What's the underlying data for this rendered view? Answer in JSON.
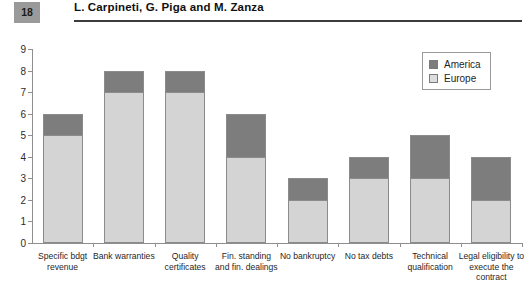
{
  "header": {
    "folio": "18",
    "authors": "L. Carpineti, G. Piga and M. Zanza"
  },
  "legend": {
    "position": "top-right",
    "entries": [
      {
        "label": "America",
        "color": "#7d7d7d",
        "swatch": "america-swatch"
      },
      {
        "label": "Europe",
        "color": "#dcdcdc",
        "swatch": "europe-swatch"
      }
    ]
  },
  "axis": {
    "y_ticks": [
      "0",
      "1",
      "2",
      "3",
      "4",
      "5",
      "6",
      "7",
      "8",
      "9"
    ]
  },
  "chart_data": {
    "type": "bar",
    "stacked": true,
    "title": "",
    "xlabel": "",
    "ylabel": "",
    "ylim": [
      0,
      9
    ],
    "yticks": [
      0,
      1,
      2,
      3,
      4,
      5,
      6,
      7,
      8,
      9
    ],
    "grid": false,
    "legend_position": "top-right",
    "categories": [
      "Specific bdgt revenue",
      "Bank warranties",
      "Quality certificates",
      "Fin. standing and fin. dealings",
      "No bankruptcy",
      "No tax debts",
      "Technical qualification",
      "Legal eligibility to execute the contract"
    ],
    "category_lines": [
      [
        "Specific bdgt",
        "revenue"
      ],
      [
        "Bank warranties"
      ],
      [
        "Quality",
        "certificates"
      ],
      [
        "Fin. standing",
        "and fin. dealings"
      ],
      [
        "No bankruptcy"
      ],
      [
        "No tax debts"
      ],
      [
        "Technical",
        "qualification"
      ],
      [
        "Legal eligibility to",
        "execute the",
        "contract"
      ]
    ],
    "series": [
      {
        "name": "Europe",
        "color": "#d4d4d4",
        "values": [
          5,
          7,
          7,
          4,
          2,
          3,
          3,
          2
        ]
      },
      {
        "name": "America",
        "color": "#7d7d7d",
        "values": [
          1,
          1,
          1,
          2,
          1,
          1,
          2,
          2
        ]
      }
    ],
    "totals": [
      6,
      8,
      8,
      6,
      3,
      4,
      5,
      4
    ]
  }
}
